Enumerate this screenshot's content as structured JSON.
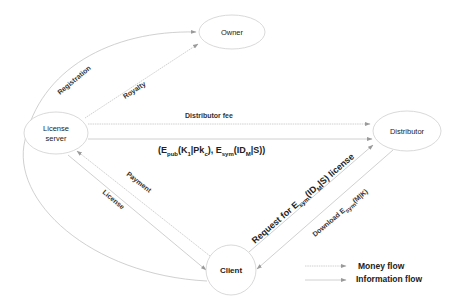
{
  "diagram": {
    "nodes": {
      "owner": {
        "label": "Owner"
      },
      "license_server": {
        "label_line1": "License",
        "label_line2": "server"
      },
      "distributor": {
        "label": "Distributor"
      },
      "client": {
        "label": "Client"
      }
    },
    "edges": {
      "registration": {
        "label": "Registration",
        "from": "Client",
        "to": "Owner",
        "flow": "information"
      },
      "royalty": {
        "label": "Royalty",
        "from": "License server",
        "to": "Owner",
        "flow": "money"
      },
      "distributor_fee": {
        "label": "Distributor fee",
        "from": "License server",
        "to": "Distributor",
        "flow": "money"
      },
      "encrypted_keys": {
        "label_parts": {
          "open": "(E",
          "pub_sub": "pub",
          "k_part": "(K",
          "k_sub": "1",
          "pk_part": "|Pk",
          "pk_sub": "c",
          "mid": "), E",
          "sym_sub": "sym",
          "id_part": "(ID",
          "id_sub": "M",
          "close": "|S))"
        },
        "from": "License server",
        "to": "Distributor",
        "flow": "information"
      },
      "payment": {
        "label": "Payment",
        "from": "Client",
        "to": "License server",
        "flow": "money"
      },
      "license": {
        "label": "License",
        "from": "License server",
        "to": "Client",
        "flow": "information"
      },
      "request": {
        "label_parts": {
          "pre": "Request for E",
          "sym_sub": "sym",
          "id_part": "(ID",
          "id_sub": "M",
          "post": "|S) license"
        },
        "from": "Client",
        "to": "Distributor",
        "flow": "information"
      },
      "download": {
        "label_parts": {
          "pre": "Download E",
          "sym_sub": "sym",
          "post": "(M|K)"
        },
        "from": "Distributor",
        "to": "Client",
        "flow": "information"
      }
    },
    "legend": {
      "money_flow": "Money flow",
      "information_flow": "Information flow"
    },
    "colors": {
      "line": "#b5b5b5",
      "arrowhead": "#9a9a9a",
      "node_stroke": "#c8c8c8",
      "text": "#222222"
    }
  }
}
